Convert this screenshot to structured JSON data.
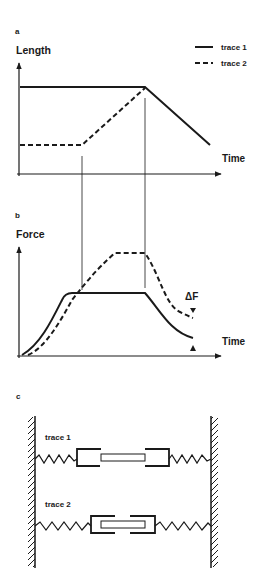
{
  "figure": {
    "panel_a": {
      "label": "a",
      "ylabel": "Length",
      "xlabel": "Time",
      "legend": [
        {
          "name": "trace 1",
          "style": "solid"
        },
        {
          "name": "trace 2",
          "style": "dashed"
        }
      ]
    },
    "panel_b": {
      "label": "b",
      "ylabel": "Force",
      "xlabel": "Time",
      "annotation": "ΔF"
    },
    "panel_c": {
      "label": "c",
      "rows": [
        {
          "label": "trace 1"
        },
        {
          "label": "trace 2"
        }
      ]
    }
  },
  "colors": {
    "ink": "#1a1a1a",
    "background": "#ffffff"
  }
}
